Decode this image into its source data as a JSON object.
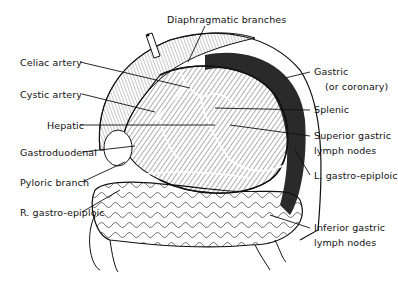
{
  "figure": {
    "type": "anatomical-illustration",
    "style": "black-and-white engraving",
    "labels": {
      "top": {
        "diaphragmatic": "Diaphragmatic branches"
      },
      "left": [
        {
          "id": "celiac",
          "text": "Celiac artery"
        },
        {
          "id": "cystic",
          "text": "Cystic artery"
        },
        {
          "id": "hepatic",
          "text": "Hepatic"
        },
        {
          "id": "gastroduodenal",
          "text": "Gastroduodenal"
        },
        {
          "id": "pyloric",
          "text": "Pyloric branch"
        },
        {
          "id": "r_gastro_epiploic",
          "text": "R. gastro-epiploic"
        }
      ],
      "right": [
        {
          "id": "gastric",
          "line1": "Gastric",
          "line2": "(or coronary)"
        },
        {
          "id": "splenic",
          "text": "Splenic"
        },
        {
          "id": "superior_gastric_ln",
          "line1": "Superior gastric",
          "line2": "lymph nodes"
        },
        {
          "id": "l_gastro_epiploic",
          "text": "L. gastro-epiploic"
        },
        {
          "id": "inferior_gastric_ln",
          "line1": "Inferior gastric",
          "line2": "lymph nodes"
        }
      ]
    },
    "colors": {
      "ink": "#111111",
      "background": "#ffffff",
      "shadow": "#2a2a2a"
    }
  }
}
